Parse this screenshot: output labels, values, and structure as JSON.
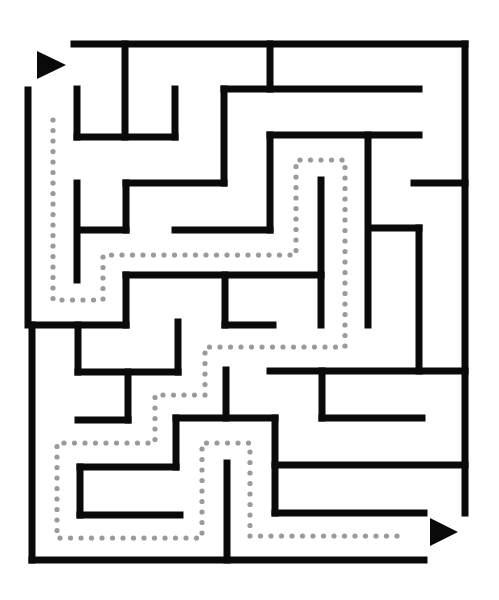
{
  "maze": {
    "title": "Maze puzzle with solution path",
    "wall_color": "#0a0a0a",
    "path_color": "#9a9a9a",
    "background": "#ffffff",
    "start_arrow": {
      "points": "37,51 66,65 37,79",
      "label": "start"
    },
    "end_arrow": {
      "points": "430,518 458,532 430,546",
      "label": "finish"
    },
    "walls": [
      [
        74,
        44,
        465,
        44
      ],
      [
        465,
        44,
        465,
        513
      ],
      [
        28,
        90,
        28,
        325
      ],
      [
        32,
        325,
        32,
        560
      ],
      [
        32,
        560,
        424,
        560
      ],
      [
        125,
        44,
        125,
        137
      ],
      [
        270,
        44,
        270,
        89
      ],
      [
        77,
        89,
        77,
        137
      ],
      [
        175,
        89,
        175,
        137
      ],
      [
        77,
        137,
        175,
        137
      ],
      [
        224,
        89,
        419,
        89
      ],
      [
        224,
        89,
        224,
        183
      ],
      [
        126,
        183,
        224,
        183
      ],
      [
        126,
        183,
        126,
        230
      ],
      [
        80,
        230,
        126,
        230
      ],
      [
        77,
        183,
        77,
        280
      ],
      [
        270,
        135,
        419,
        135
      ],
      [
        270,
        135,
        270,
        230
      ],
      [
        175,
        230,
        270,
        230
      ],
      [
        368,
        135,
        368,
        325
      ],
      [
        414,
        183,
        465,
        183
      ],
      [
        321,
        180,
        321,
        325
      ],
      [
        370,
        228,
        419,
        228
      ],
      [
        419,
        228,
        419,
        371
      ],
      [
        126,
        275,
        321,
        275
      ],
      [
        126,
        275,
        126,
        325
      ],
      [
        32,
        325,
        126,
        325
      ],
      [
        225,
        275,
        225,
        325
      ],
      [
        225,
        325,
        273,
        325
      ],
      [
        78,
        325,
        78,
        372
      ],
      [
        78,
        372,
        178,
        372
      ],
      [
        178,
        322,
        178,
        372
      ],
      [
        128,
        372,
        128,
        420
      ],
      [
        78,
        420,
        128,
        420
      ],
      [
        270,
        371,
        465,
        371
      ],
      [
        322,
        371,
        322,
        418
      ],
      [
        322,
        418,
        422,
        418
      ],
      [
        226,
        370,
        226,
        418
      ],
      [
        176,
        418,
        275,
        418
      ],
      [
        176,
        418,
        176,
        467
      ],
      [
        80,
        467,
        176,
        467
      ],
      [
        80,
        467,
        80,
        515
      ],
      [
        80,
        515,
        180,
        515
      ],
      [
        275,
        418,
        275,
        513
      ],
      [
        275,
        465,
        465,
        465
      ],
      [
        275,
        513,
        424,
        513
      ],
      [
        227,
        463,
        227,
        560
      ]
    ],
    "solution_path": [
      [
        53,
        120
      ],
      [
        53,
        300
      ],
      [
        103,
        300
      ],
      [
        103,
        255
      ],
      [
        296,
        255
      ],
      [
        296,
        160
      ],
      [
        345,
        160
      ],
      [
        345,
        347
      ],
      [
        205,
        347
      ],
      [
        205,
        395
      ],
      [
        155,
        395
      ],
      [
        155,
        443
      ],
      [
        57,
        443
      ],
      [
        57,
        538
      ],
      [
        202,
        538
      ],
      [
        202,
        443
      ],
      [
        250,
        443
      ],
      [
        250,
        536
      ],
      [
        400,
        536
      ]
    ],
    "dot_spacing": 10.5
  }
}
